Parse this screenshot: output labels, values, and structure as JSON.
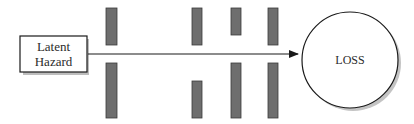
{
  "diagram": {
    "source": {
      "lines": [
        "Latent",
        "Hazard"
      ]
    },
    "target": {
      "label": "LOSS"
    },
    "barriers": [
      {
        "name": "barrier-1",
        "top_hole": false
      },
      {
        "name": "barrier-2",
        "top_hole": false
      },
      {
        "name": "barrier-3",
        "top_hole": false
      },
      {
        "name": "barrier-4",
        "top_hole": false
      }
    ],
    "colors": {
      "barrier_fill": "#6e6e6e",
      "barrier_stroke": "#3a3a3a",
      "line": "#1a1a1a",
      "shadow": "#b5b5b5"
    }
  }
}
